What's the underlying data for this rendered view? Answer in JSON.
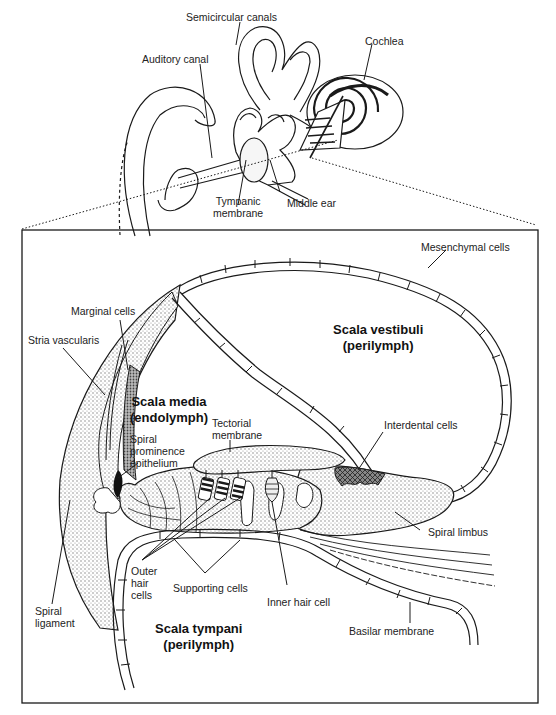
{
  "overview": {
    "labels": {
      "semicircular_canals": "Semicircular canals",
      "auditory_canal": "Auditory canal",
      "cochlea": "Cochlea",
      "tympanic_membrane_1": "Tympanic",
      "tympanic_membrane_2": "membrane",
      "middle_ear": "Middle ear"
    }
  },
  "cross_section": {
    "regions": {
      "scala_vestibuli_1": "Scala vestibuli",
      "scala_vestibuli_2": "(perilymph)",
      "scala_media_1": "Scala media",
      "scala_media_2": "(endolymph)",
      "scala_tympani_1": "Scala tympani",
      "scala_tympani_2": "(perilymph)"
    },
    "labels": {
      "mesenchymal_cells": "Mesenchymal cells",
      "marginal_cells": "Marginal cells",
      "stria_vascularis": "Stria vascularis",
      "tectorial_membrane_1": "Tectorial",
      "tectorial_membrane_2": "membrane",
      "spiral_prominence_1": "Spiral",
      "spiral_prominence_2": "prominence",
      "spiral_prominence_3": "epithelium",
      "interdental_cells": "Interdental cells",
      "spiral_limbus": "Spiral limbus",
      "outer_hair_cells_1": "Outer",
      "outer_hair_cells_2": "hair",
      "outer_hair_cells_3": "cells",
      "supporting_cells": "Supporting cells",
      "inner_hair_cell": "Inner hair cell",
      "spiral_ligament_1": "Spiral",
      "spiral_ligament_2": "ligament",
      "basilar_membrane": "Basilar membrane"
    }
  },
  "colors": {
    "ink": "#1a1a1a",
    "stipple": "#cfcfcf",
    "dense_stipple": "#9a9a9a",
    "background": "#ffffff"
  }
}
